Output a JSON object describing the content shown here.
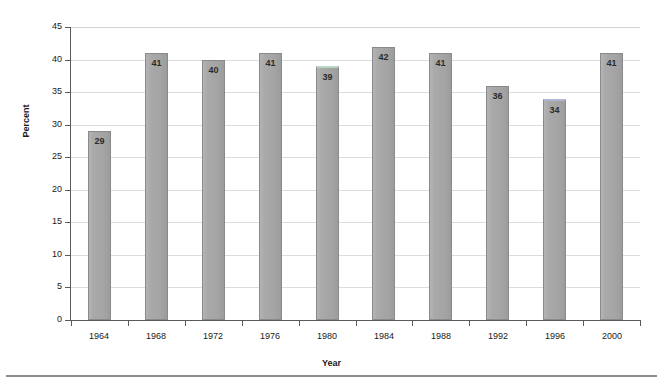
{
  "chart_data": {
    "type": "bar",
    "title": "",
    "subtitle": "",
    "xlabel": "Year",
    "ylabel": "Percent",
    "categories": [
      "1964",
      "1968",
      "1972",
      "1976",
      "1980",
      "1984",
      "1988",
      "1992",
      "1996",
      "2000"
    ],
    "values": [
      29,
      41,
      40,
      41,
      39,
      42,
      41,
      36,
      34,
      41
    ],
    "data_labels": [
      "29",
      "41",
      "40",
      "41",
      "39",
      "42",
      "41",
      "36",
      "34",
      "41"
    ],
    "ylim": [
      0,
      45
    ],
    "ytick_step": 5,
    "ytick_labels": [
      "0",
      "5",
      "10",
      "15",
      "20",
      "25",
      "30",
      "35",
      "40",
      "45"
    ],
    "ytick_values": [
      0,
      5,
      10,
      15,
      20,
      25,
      30,
      35,
      40,
      45
    ],
    "xtick_labels": [
      "1964",
      "1968",
      "1972",
      "1976",
      "1980",
      "1984",
      "1988",
      "1992",
      "1996",
      "2000"
    ],
    "grid": "horizontal",
    "legend": "none",
    "series": [
      {
        "name": "Percent",
        "values": [
          29,
          41,
          40,
          41,
          39,
          42,
          41,
          36,
          34,
          41
        ]
      }
    ],
    "bar_colors": {
      "default": "#a8a8a8",
      "border": "#8a8a8a",
      "highlight_1980_top": "#b9d6c4",
      "highlight_1996_top": "#b3b6d2"
    },
    "colors": {
      "background": "#ffffff",
      "gridline": "#dcdcdc",
      "axis": "#5a5a5a",
      "text": "#1a1a1a",
      "rule": "#8d8d8d"
    }
  }
}
